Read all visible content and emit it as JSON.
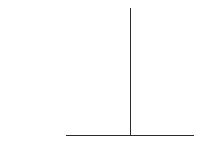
{
  "diagram": {
    "line_color": "#2b2b2b",
    "background": "#ffffff",
    "vertical_line": {
      "x": 130,
      "y1": 8,
      "y2": 135
    },
    "horizontal_line": {
      "x1": 66,
      "x2": 194,
      "y": 135
    }
  }
}
